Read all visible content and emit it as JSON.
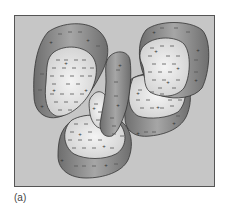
{
  "figure": {
    "caption": "(a)",
    "background_color": "#c8c8c8",
    "frame_color": "#555555",
    "shell_color": "#8a8a8a",
    "core_color": "#e2e2e2",
    "symbols": {
      "negative": "−",
      "positive": "+"
    }
  },
  "particles": [
    {
      "name": "top-left-aggregate",
      "shell_label_plus": [
        "+",
        "+",
        "+"
      ],
      "core_label_plus": [
        "+",
        "+",
        "+"
      ]
    },
    {
      "name": "center-vertical-aggregate",
      "shell_label_plus": [
        "+",
        "+",
        "+"
      ]
    },
    {
      "name": "top-right-aggregate",
      "shell_label_plus": [
        "+",
        "+",
        "+",
        "+"
      ],
      "core_label_plus": [
        "+",
        "+",
        "+"
      ]
    },
    {
      "name": "middle-right-aggregate",
      "shell_label_plus": [
        "+",
        "+"
      ],
      "core_label_plus": [
        "+",
        "+"
      ]
    },
    {
      "name": "bottom-aggregate",
      "shell_label_plus": [
        "+",
        "+"
      ],
      "core_label_plus": [
        "+",
        "+"
      ]
    },
    {
      "name": "small-center-core",
      "core_label_plus": [
        "+"
      ]
    }
  ]
}
